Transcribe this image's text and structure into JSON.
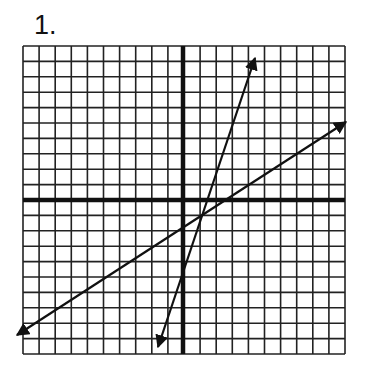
{
  "problem": {
    "number_label": "1."
  },
  "grid": {
    "columns": 20,
    "rows": 20,
    "x_range": [
      -10,
      10
    ],
    "y_range": [
      -10,
      10
    ],
    "line_color": "#222222",
    "axis_color": "#111111",
    "pixel_box": {
      "left": 23,
      "top": 46,
      "right": 345,
      "bottom": 354
    },
    "origin_px": {
      "x": 183,
      "y": 200
    }
  },
  "lines": [
    {
      "name": "steep-line",
      "start_px": {
        "x": 158,
        "y": 347
      },
      "end_px": {
        "x": 255,
        "y": 58
      },
      "approx_grid_points": [
        [
          -1.55,
          -9.5
        ],
        [
          4.5,
          9.2
        ]
      ],
      "approx_y_intercept": -4.35,
      "approx_x_intercept": 1.55
    },
    {
      "name": "shallow-line",
      "start_px": {
        "x": 17,
        "y": 335
      },
      "end_px": {
        "x": 346,
        "y": 122
      },
      "approx_grid_points": [
        [
          -10.3,
          -8.8
        ],
        [
          10.1,
          5.1
        ]
      ],
      "approx_y_intercept": -1.75,
      "approx_x_intercept": 2.3
    }
  ]
}
